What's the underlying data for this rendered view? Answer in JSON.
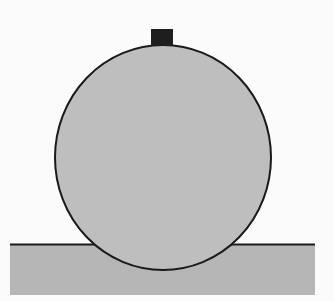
{
  "diagram": {
    "colors": {
      "background": "#fbfbfb",
      "ball_fill": "#bebebe",
      "ground_fill": "#b6b6b6",
      "outline": "#1a1a1a",
      "block": "#1e1e1e"
    },
    "ground": {
      "x": 10,
      "y": 244,
      "width": 305,
      "height": 51
    },
    "ball": {
      "cx": 163,
      "cy": 157.5,
      "rx": 108,
      "ry": 112.5
    },
    "block": {
      "x": 151,
      "y": 29,
      "width": 22,
      "height": 17
    }
  }
}
